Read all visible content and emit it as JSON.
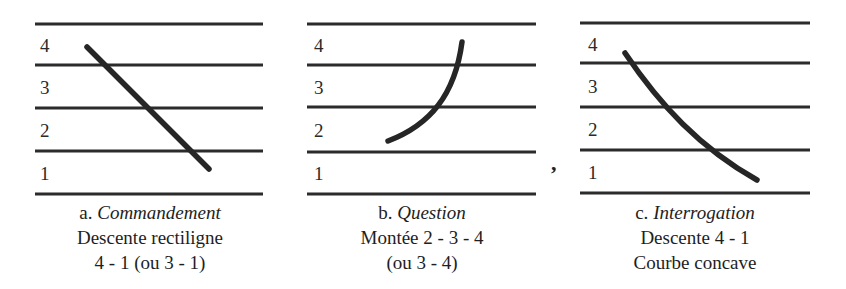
{
  "levels": [
    "1",
    "2",
    "3",
    "4"
  ],
  "panels": [
    {
      "id": "a",
      "letter": "a.",
      "title": "Commandement",
      "line1": "Descente rectiligne",
      "line2": "4 - 1 (ou 3 - 1)",
      "contour": "straight descending line from level 4 to level 1"
    },
    {
      "id": "b",
      "letter": "b.",
      "title": "Question",
      "line1": "Montée 2 - 3 - 4",
      "line2": "(ou 3 - 4)",
      "contour": "rising curve from level 2 to level 4, steepening upward"
    },
    {
      "id": "c",
      "letter": "c.",
      "title": "Interrogation",
      "line1": "Descente 4 - 1",
      "line2": "Courbe concave",
      "contour": "descending concave curve from level 4 to level 1"
    }
  ],
  "stray_mark": ",",
  "colors": {
    "staff_line": "#2b2b2b",
    "contour": "#262626",
    "text": "#1e1e1e"
  }
}
